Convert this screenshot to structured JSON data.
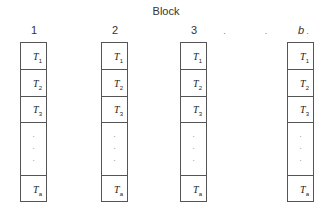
{
  "diagram": {
    "title": "Block",
    "columns": [
      {
        "label": "1",
        "italic": false
      },
      {
        "label": "2",
        "italic": false
      },
      {
        "label": "3",
        "italic": false
      },
      {
        "label": "b",
        "italic": true
      }
    ],
    "ellipsis": "· · ·",
    "cells": [
      {
        "base": "T",
        "sub": "1"
      },
      {
        "base": "T",
        "sub": "2"
      },
      {
        "base": "T",
        "sub": "3"
      },
      {
        "base": "",
        "sub": "",
        "vdots": "·\n·\n·"
      },
      {
        "base": "T",
        "sub": "a"
      }
    ]
  }
}
